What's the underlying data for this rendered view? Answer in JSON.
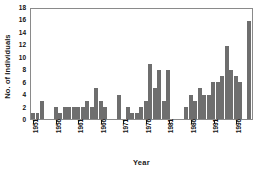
{
  "chart_data": {
    "type": "bar",
    "title": "",
    "xlabel": "Year",
    "ylabel": "No. of Individuals",
    "ylim": [
      0,
      18
    ],
    "ytick_values": [
      0,
      2,
      4,
      6,
      8,
      10,
      12,
      14,
      16,
      18
    ],
    "ytick_labels": [
      "0",
      "2",
      "4",
      "6",
      "8",
      "10",
      "12",
      "14",
      "16",
      "18"
    ],
    "xtick_labels": [
      "1951",
      "1956",
      "1961",
      "1966",
      "1971",
      "1976",
      "1981",
      "1986",
      "1991",
      "1996"
    ],
    "xtick_years": [
      1951,
      1956,
      1961,
      1966,
      1971,
      1976,
      1981,
      1986,
      1991,
      1996
    ],
    "grid": false,
    "legend": null,
    "bar_color": "#6e6e6e",
    "frame_color": "#8a8a8a",
    "x": [
      1951,
      1952,
      1953,
      1954,
      1955,
      1956,
      1957,
      1958,
      1959,
      1960,
      1961,
      1962,
      1963,
      1964,
      1965,
      1966,
      1967,
      1968,
      1969,
      1970,
      1971,
      1972,
      1973,
      1974,
      1975,
      1976,
      1977,
      1978,
      1979,
      1980,
      1981,
      1982,
      1983,
      1984,
      1985,
      1986,
      1987,
      1988,
      1989,
      1990,
      1991,
      1992,
      1993,
      1994,
      1995,
      1996,
      1997,
      1998,
      1999
    ],
    "categories": [
      "1951",
      "1952",
      "1953",
      "1954",
      "1955",
      "1956",
      "1957",
      "1958",
      "1959",
      "1960",
      "1961",
      "1962",
      "1963",
      "1964",
      "1965",
      "1966",
      "1967",
      "1968",
      "1969",
      "1970",
      "1971",
      "1972",
      "1973",
      "1974",
      "1975",
      "1976",
      "1977",
      "1978",
      "1979",
      "1980",
      "1981",
      "1982",
      "1983",
      "1984",
      "1985",
      "1986",
      "1987",
      "1988",
      "1989",
      "1990",
      "1991",
      "1992",
      "1993",
      "1994",
      "1995",
      "1996",
      "1997",
      "1998",
      "1999"
    ],
    "values": [
      1,
      1,
      3,
      0,
      0,
      2,
      1,
      2,
      2,
      2,
      2,
      2,
      3,
      2,
      5,
      3,
      2,
      0,
      0,
      4,
      0,
      2,
      1,
      1,
      2,
      3,
      9,
      5,
      8,
      3,
      8,
      0,
      0,
      0,
      2,
      4,
      3,
      5,
      4,
      4,
      6,
      6,
      7,
      12,
      8,
      7,
      6,
      0,
      16
    ]
  }
}
